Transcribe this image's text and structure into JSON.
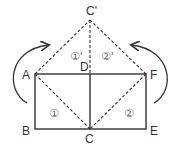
{
  "diagram": {
    "points": {
      "A": {
        "label": "A",
        "x": 35,
        "y": 74
      },
      "B": {
        "label": "B",
        "x": 35,
        "y": 129
      },
      "C": {
        "label": "C",
        "x": 90,
        "y": 129
      },
      "D": {
        "label": "D",
        "x": 90,
        "y": 74
      },
      "E": {
        "label": "E",
        "x": 146,
        "y": 129
      },
      "F": {
        "label": "F",
        "x": 146,
        "y": 74
      },
      "Cp": {
        "label": "C'",
        "x": 90,
        "y": 20
      }
    },
    "regions": {
      "r1": "①",
      "r2": "②",
      "r1p": "①'",
      "r2p": "②'"
    },
    "colors": {
      "line": "#333333",
      "label": "#333333",
      "region": "#666666"
    }
  }
}
